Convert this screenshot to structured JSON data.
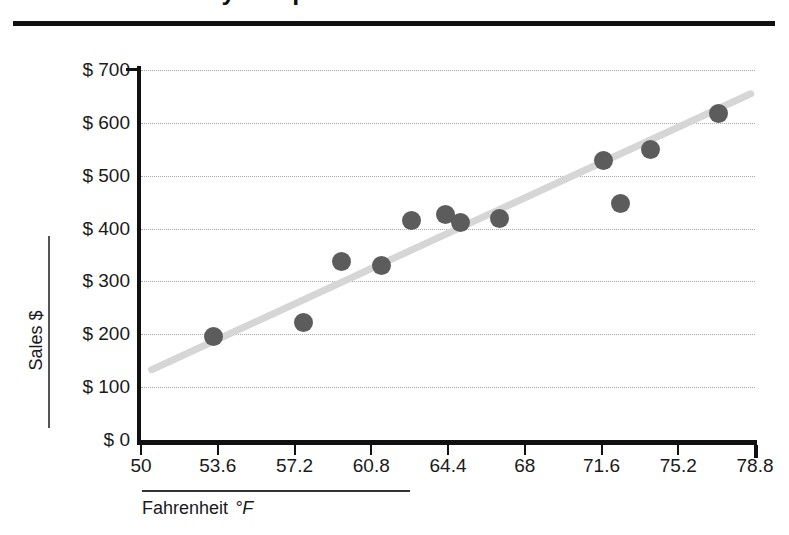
{
  "title": "Sales versus Daily Temperature",
  "axes": {
    "y_title": "Sales  $",
    "x_title": "Fahrenheit",
    "x_unit": "°F"
  },
  "chart_data": {
    "type": "scatter",
    "title": "Sales versus Daily Temperature",
    "xlabel": "Fahrenheit °F",
    "ylabel": "Sales $",
    "xlim": [
      50,
      78.8
    ],
    "ylim": [
      0,
      700
    ],
    "grid": true,
    "legend": "none",
    "x_ticks": [
      "50",
      "53.6",
      "57.2",
      "60.8",
      "64.4",
      "68",
      "71.6",
      "75.2",
      "78.8"
    ],
    "x_tick_values": [
      50,
      53.6,
      57.2,
      60.8,
      64.4,
      68,
      71.6,
      75.2,
      78.8
    ],
    "y_ticks": [
      "$ 0",
      "$ 100",
      "$ 200",
      "$ 300",
      "$ 400",
      "$ 500",
      "$ 600",
      "$ 700"
    ],
    "y_tick_values": [
      0,
      100,
      200,
      300,
      400,
      500,
      600,
      700
    ],
    "marker_color": "#5c5c5c",
    "trendline_color": "#d6d6d6",
    "points": [
      {
        "x": 53.4,
        "y": 195
      },
      {
        "x": 57.6,
        "y": 222
      },
      {
        "x": 59.4,
        "y": 338
      },
      {
        "x": 61.3,
        "y": 331
      },
      {
        "x": 62.7,
        "y": 416
      },
      {
        "x": 64.3,
        "y": 426
      },
      {
        "x": 65.0,
        "y": 412
      },
      {
        "x": 66.8,
        "y": 419
      },
      {
        "x": 71.7,
        "y": 528
      },
      {
        "x": 72.5,
        "y": 447
      },
      {
        "x": 73.9,
        "y": 549
      },
      {
        "x": 77.1,
        "y": 618
      }
    ],
    "trendline": {
      "x_start": 50.5,
      "y_start": 133,
      "x_end": 78.6,
      "y_end": 655
    }
  }
}
